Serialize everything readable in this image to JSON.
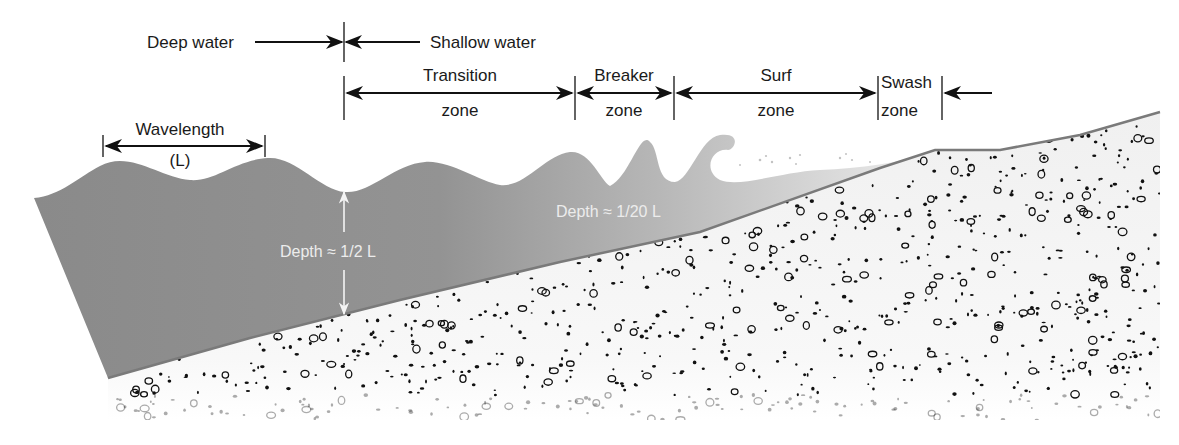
{
  "diagram": {
    "colors": {
      "water_deep": "#8a8a8a",
      "water_shallow": "#c4c4c4",
      "sand": "#f2f2f2",
      "pebbles": "#111111",
      "lines": "#111111",
      "white_text": "#ececec"
    },
    "labels": {
      "deep_water": "Deep water",
      "shallow_water": "Shallow water",
      "wavelength": "Wavelength",
      "wavelength_symbol": "(L)",
      "depth_deep": "Depth ≈ 1/2 L",
      "depth_shallow": "Depth ≈ 1/20 L"
    },
    "zones": [
      {
        "name": "Transition",
        "sub": "zone"
      },
      {
        "name": "Breaker",
        "sub": "zone"
      },
      {
        "name": "Surf",
        "sub": "zone"
      },
      {
        "name": "Swash",
        "sub": "zone"
      }
    ]
  }
}
